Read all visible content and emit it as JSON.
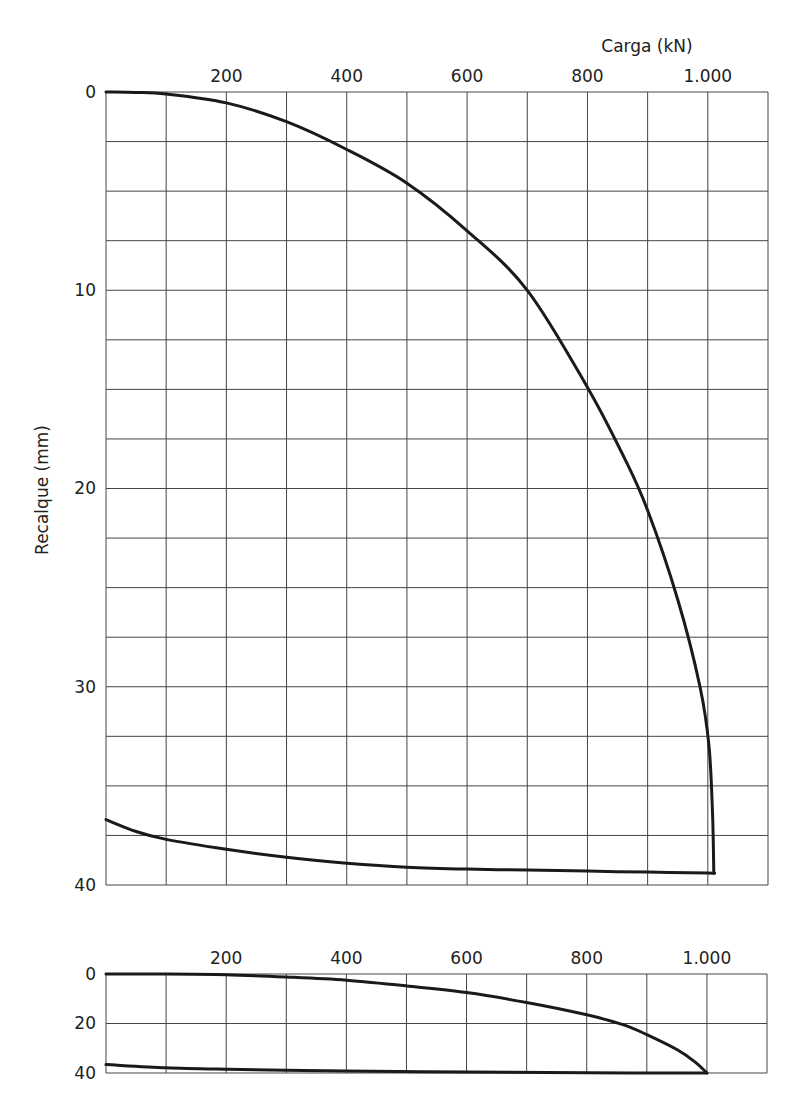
{
  "chart_data": [
    {
      "type": "line",
      "title": "",
      "xlabel": "Carga (kN)",
      "ylabel": "Recalque (mm)",
      "x_axis_position": "top",
      "y_axis_inverted": true,
      "xlim": [
        0,
        1100
      ],
      "ylim": [
        0,
        40
      ],
      "x_grid_step": 100,
      "y_grid_step": 2.5,
      "grid": true,
      "x_tick_labels": [
        {
          "value": 200,
          "label": "200"
        },
        {
          "value": 400,
          "label": "400"
        },
        {
          "value": 600,
          "label": "600"
        },
        {
          "value": 800,
          "label": "800"
        },
        {
          "value": 1000,
          "label": "1.000"
        }
      ],
      "y_tick_labels": [
        {
          "value": 0,
          "label": "0"
        },
        {
          "value": 10,
          "label": "10"
        },
        {
          "value": 20,
          "label": "20"
        },
        {
          "value": 30,
          "label": "30"
        },
        {
          "value": 40,
          "label": "40"
        }
      ],
      "series": [
        {
          "name": "Carregamento",
          "x": [
            0,
            50,
            100,
            200,
            300,
            400,
            500,
            600,
            700,
            800,
            862,
            900,
            950,
            987,
            1002,
            1008,
            1010
          ],
          "y": [
            0,
            0.02,
            0.1,
            0.55,
            1.5,
            2.9,
            4.6,
            7.0,
            10.0,
            14.9,
            18.5,
            21.1,
            25.6,
            30.0,
            33.0,
            36.5,
            39.4
          ]
        },
        {
          "name": "Descarregamento",
          "x": [
            1010,
            1000,
            900,
            800,
            700,
            600,
            500,
            400,
            300,
            200,
            100,
            50,
            0
          ],
          "y": [
            39.4,
            39.4,
            39.35,
            39.3,
            39.25,
            39.2,
            39.1,
            38.9,
            38.6,
            38.2,
            37.7,
            37.3,
            36.7
          ]
        }
      ]
    },
    {
      "type": "line",
      "title": "",
      "xlabel": "",
      "ylabel": "",
      "x_axis_position": "top",
      "y_axis_inverted": true,
      "xlim": [
        0,
        1100
      ],
      "ylim": [
        0,
        40
      ],
      "x_grid_step": 100,
      "y_grid_step": 20,
      "grid": true,
      "x_tick_labels": [
        {
          "value": 200,
          "label": "200"
        },
        {
          "value": 400,
          "label": "400"
        },
        {
          "value": 600,
          "label": "600"
        },
        {
          "value": 800,
          "label": "800"
        },
        {
          "value": 1000,
          "label": "1.000"
        }
      ],
      "y_tick_labels": [
        {
          "value": 0,
          "label": "0"
        },
        {
          "value": 20,
          "label": "20"
        },
        {
          "value": 40,
          "label": "40"
        }
      ],
      "series": [
        {
          "name": "Carregamento",
          "x": [
            0,
            100,
            200,
            300,
            400,
            500,
            600,
            700,
            800,
            860,
            900,
            950,
            980,
            1000
          ],
          "y": [
            0,
            0,
            0.3,
            1.2,
            2.5,
            4.8,
            7.5,
            11.5,
            16.5,
            20.5,
            24.5,
            30.5,
            35.5,
            40
          ]
        },
        {
          "name": "Descarregamento",
          "x": [
            1000,
            800,
            600,
            400,
            300,
            200,
            100,
            0
          ],
          "y": [
            40,
            39.9,
            39.6,
            39.2,
            38.9,
            38.5,
            37.9,
            36.6
          ]
        }
      ]
    }
  ],
  "main_chart": {
    "xlabel": "Carga (kN)",
    "ylabel": "Recalque (mm)"
  },
  "style": {
    "line_color": "#1a1a1a",
    "grid_color": "#444444",
    "background": "#ffffff"
  }
}
